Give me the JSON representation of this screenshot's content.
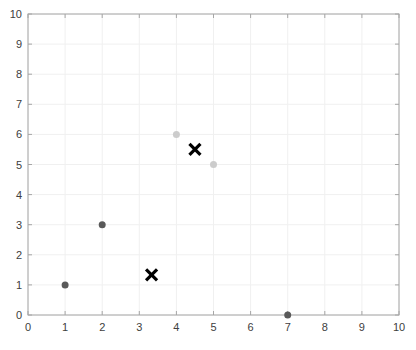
{
  "chart_data": {
    "type": "scatter",
    "title": "",
    "xlabel": "",
    "ylabel": "",
    "xlim": [
      0,
      10
    ],
    "ylim": [
      0,
      10
    ],
    "xticks": [
      0,
      1,
      2,
      3,
      4,
      5,
      6,
      7,
      8,
      9,
      10
    ],
    "yticks": [
      0,
      1,
      2,
      3,
      4,
      5,
      6,
      7,
      8,
      9,
      10
    ],
    "grid": true,
    "legend": null,
    "series": [
      {
        "name": "cluster-1",
        "color": "#595959",
        "marker": "circle",
        "points": [
          [
            1,
            1
          ],
          [
            2,
            3
          ],
          [
            7,
            0
          ]
        ]
      },
      {
        "name": "cluster-2",
        "color": "#cccccc",
        "marker": "circle",
        "points": [
          [
            4,
            6
          ],
          [
            5,
            5
          ]
        ]
      },
      {
        "name": "centroids",
        "color": "#000000",
        "marker": "x",
        "points": [
          [
            4.5,
            5.5
          ],
          [
            3.33,
            1.33
          ]
        ]
      }
    ]
  },
  "colors": {
    "axis": "#a6a6a6",
    "grid": "#f0f0f0",
    "tick_label": "#404040"
  }
}
